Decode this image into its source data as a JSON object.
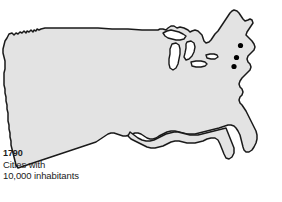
{
  "figure": {
    "name": "us-cities-1790-map",
    "background_color": "#ffffff"
  },
  "caption": {
    "year": "1790",
    "line1": "Cities with",
    "line2": "10,000 inhabitants",
    "text_color": "#1b1b1b"
  },
  "map": {
    "region": "Contiguous United States",
    "land_fill": "#e3e3e3",
    "land_stroke": "#1a1a1a",
    "lake_fill": "#ffffff",
    "lake_stroke": "#1a1a1a",
    "dot_color": "#000000",
    "dot_count": 3,
    "dot_radius": 2.6,
    "dots": [
      {
        "name": "city-dot-boston",
        "x": 240.5,
        "y": 45.5
      },
      {
        "name": "city-dot-new-york",
        "x": 236.5,
        "y": 57.5
      },
      {
        "name": "city-dot-philadelphia",
        "x": 234.0,
        "y": 66.5
      }
    ],
    "lakes": [
      {
        "name": "lake-superior"
      },
      {
        "name": "lake-michigan"
      },
      {
        "name": "lake-huron"
      },
      {
        "name": "lake-erie"
      },
      {
        "name": "lake-ontario"
      }
    ]
  }
}
